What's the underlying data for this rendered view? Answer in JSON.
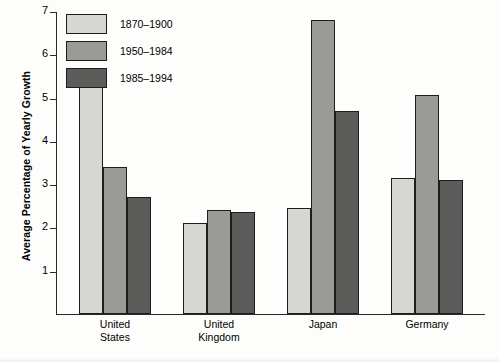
{
  "chart_data": {
    "type": "bar",
    "title": "",
    "xlabel": "",
    "ylabel": "Average Percentage of Yearly Growth",
    "ylim": [
      0,
      7
    ],
    "yticks": [
      "1",
      "2",
      "3",
      "4",
      "5",
      "6",
      "7"
    ],
    "grid": false,
    "legend_position": "top-left",
    "categories": [
      "United States",
      "United Kingdom",
      "Japan",
      "Germany"
    ],
    "category_lines": [
      [
        "United",
        "States"
      ],
      [
        "United",
        "Kingdom"
      ],
      [
        "Japan",
        ""
      ],
      [
        "Germany",
        ""
      ]
    ],
    "series": [
      {
        "name": "1870–1900",
        "color": "#d6d6d2",
        "values": [
          5.35,
          2.1,
          2.45,
          3.15
        ]
      },
      {
        "name": "1950–1984",
        "color": "#9a9a96",
        "values": [
          3.4,
          2.4,
          6.8,
          5.05
        ]
      },
      {
        "name": "1985–1994",
        "color": "#5c5c5a",
        "values": [
          2.7,
          2.35,
          4.7,
          3.1
        ]
      }
    ]
  },
  "legend": {
    "items": [
      {
        "label": "1870–1900",
        "swatch": "#d6d6d2"
      },
      {
        "label": "1950–1984",
        "swatch": "#9a9a96"
      },
      {
        "label": "1985–1994",
        "swatch": "#5c5c5a"
      }
    ]
  },
  "axis": {
    "y_title": "Average Percentage of Yearly Growth",
    "y_ticks": [
      "7",
      "6",
      "5",
      "4",
      "3",
      "2",
      "1"
    ]
  }
}
